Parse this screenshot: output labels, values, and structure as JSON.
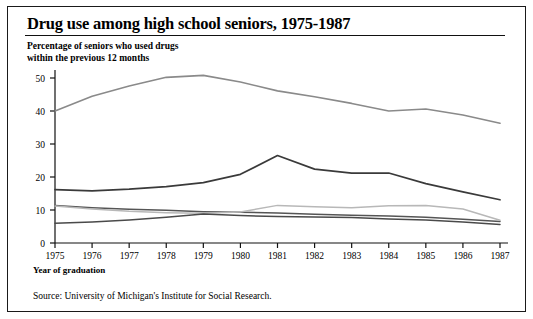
{
  "title": "Drug use among high school seniors, 1975-1987",
  "subtitle": "Percentage of seniors who used drugs\nwithin the previous 12 months",
  "xaxis_title": "Year of graduation",
  "source": "Source: University of Michigan's Institute for Social Research.",
  "colors": {
    "frame": "#1a1a1a",
    "axis": "#111111",
    "text": "#000000",
    "series_top": "#8a8a8a",
    "series_dark": "#3a3a3a",
    "series_mid": "#555555",
    "series_light": "#b8b8b8",
    "series_low": "#4a4a4a"
  },
  "chart_data": {
    "type": "line",
    "title": "Drug use among high school seniors, 1975-1987",
    "subtitle": "Percentage of seniors who used drugs within the previous 12 months",
    "xlabel": "Year of graduation",
    "ylabel": "",
    "x": [
      1975,
      1976,
      1977,
      1978,
      1979,
      1980,
      1981,
      1982,
      1983,
      1984,
      1985,
      1986,
      1987
    ],
    "xtick_labels": [
      "1975",
      "1976",
      "1977",
      "1978",
      "1979",
      "1980",
      "1981",
      "1982",
      "1983",
      "1984",
      "1985",
      "1986",
      "1987"
    ],
    "ytick_labels": [
      "0",
      "10",
      "20",
      "30",
      "40",
      "50"
    ],
    "yticks": [
      0,
      10,
      20,
      30,
      40,
      50
    ],
    "ylim": [
      0,
      54
    ],
    "xlim": [
      1975,
      1987
    ],
    "grid": false,
    "legend": "none",
    "series": [
      {
        "name": "series-1",
        "color": "#8a8a8a",
        "width": 1.6,
        "values": [
          40.0,
          44.5,
          47.6,
          50.2,
          50.8,
          48.8,
          46.1,
          44.3,
          42.3,
          40.0,
          40.6,
          38.8,
          36.3
        ]
      },
      {
        "name": "series-2",
        "color": "#3a3a3a",
        "width": 1.7,
        "values": [
          16.2,
          15.8,
          16.3,
          17.1,
          18.3,
          20.8,
          26.5,
          22.4,
          21.2,
          21.2,
          18.0,
          15.5,
          13.1
        ]
      },
      {
        "name": "series-3",
        "color": "#555555",
        "width": 1.5,
        "values": [
          11.4,
          10.7,
          10.2,
          9.9,
          9.5,
          9.3,
          9.1,
          8.7,
          8.4,
          8.2,
          7.8,
          7.2,
          6.5
        ]
      },
      {
        "name": "series-4",
        "color": "#b8b8b8",
        "width": 1.5,
        "values": [
          11.2,
          10.3,
          9.6,
          9.2,
          9.0,
          9.4,
          11.4,
          11.0,
          10.7,
          11.3,
          11.4,
          10.3,
          6.9
        ]
      },
      {
        "name": "series-5",
        "color": "#4a4a4a",
        "width": 1.5,
        "values": [
          6.0,
          6.4,
          7.0,
          7.8,
          8.8,
          8.3,
          8.0,
          7.9,
          7.7,
          7.3,
          7.0,
          6.4,
          5.6
        ]
      }
    ]
  }
}
